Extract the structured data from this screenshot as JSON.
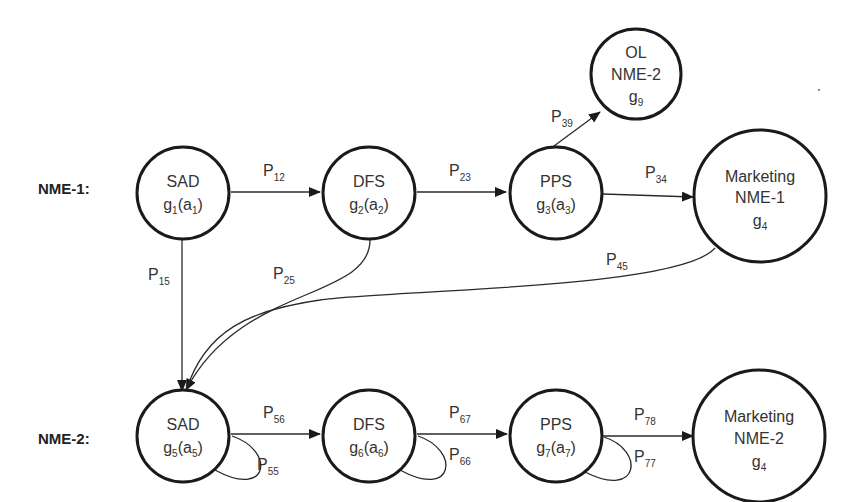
{
  "rows": {
    "nme1": "NME-1:",
    "nme2": "NME-2:"
  },
  "nodes": {
    "sad1": {
      "title": "SAD",
      "fn": "g",
      "fn_sub": "1",
      "arg": "a",
      "arg_sub": "1"
    },
    "dfs2": {
      "title": "DFS",
      "fn": "g",
      "fn_sub": "2",
      "arg": "a",
      "arg_sub": "2"
    },
    "pps3": {
      "title": "PPS",
      "fn": "g",
      "fn_sub": "3",
      "arg": "a",
      "arg_sub": "3"
    },
    "mkt4": {
      "line1": "Marketing",
      "line2": "NME-1",
      "fn": "g",
      "fn_sub": "4"
    },
    "ol9": {
      "line1": "OL",
      "line2": "NME-2",
      "fn": "g",
      "fn_sub": "9"
    },
    "sad5": {
      "title": "SAD",
      "fn": "g",
      "fn_sub": "5",
      "arg": "a",
      "arg_sub": "5"
    },
    "dfs6": {
      "title": "DFS",
      "fn": "g",
      "fn_sub": "6",
      "arg": "a",
      "arg_sub": "6"
    },
    "pps7": {
      "title": "PPS",
      "fn": "g",
      "fn_sub": "7",
      "arg": "a",
      "arg_sub": "7"
    },
    "mkt8": {
      "line1": "Marketing",
      "line2": "NME-2",
      "fn": "g",
      "fn_sub": "4"
    }
  },
  "edges": {
    "p12": {
      "p": "P",
      "sub": "12"
    },
    "p23": {
      "p": "P",
      "sub": "23"
    },
    "p34": {
      "p": "P",
      "sub": "34"
    },
    "p39": {
      "p": "P",
      "sub": "39"
    },
    "p15": {
      "p": "P",
      "sub": "15"
    },
    "p25": {
      "p": "P",
      "sub": "25"
    },
    "p45": {
      "p": "P",
      "sub": "45"
    },
    "p56": {
      "p": "P",
      "sub": "56"
    },
    "p67": {
      "p": "P",
      "sub": "67"
    },
    "p78": {
      "p": "P",
      "sub": "78"
    },
    "p55": {
      "p": "P",
      "sub": "55"
    },
    "p66": {
      "p": "P",
      "sub": "66"
    },
    "p77": {
      "p": "P",
      "sub": "77"
    }
  }
}
